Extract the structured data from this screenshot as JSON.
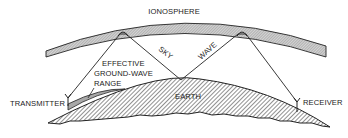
{
  "diagram": {
    "labels": {
      "ionosphere": "IONOSPHERE",
      "sky": "SKY",
      "wave": "WAVE",
      "effective_line1": "EFFECTIVE",
      "effective_line2": "GROUND-WAVE",
      "effective_line3": "RANGE",
      "transmitter": "TRANSMITTER",
      "earth": "EARTH",
      "receiver": "RECEIVER"
    },
    "colors": {
      "stroke": "#222222",
      "hatch": "#555555",
      "band_fill": "#bdbdbd",
      "ground_wave_fill": "#a8a8a8",
      "background": "#ffffff"
    }
  }
}
